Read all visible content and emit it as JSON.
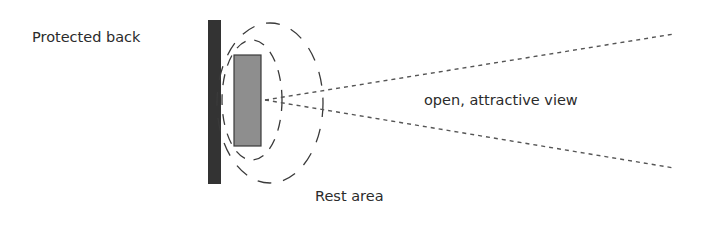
{
  "diagram": {
    "labels": {
      "protected_back": "Protected back",
      "view": "open, attractive view",
      "rest_area": "Rest area"
    },
    "colors": {
      "wall": "#333333",
      "seat_fill": "#8e8e8e",
      "seat_stroke": "#3a3a3a",
      "ellipse_stroke": "#3a3a3a",
      "sightline_stroke": "#555555",
      "text": "#2b2b2b"
    },
    "elements": {
      "wall": {
        "x": 208,
        "y": 20,
        "width": 13,
        "height": 164
      },
      "seat": {
        "x": 234,
        "y": 55,
        "width": 27,
        "height": 91
      },
      "inner_ellipse": {
        "cx": 252,
        "cy": 100,
        "rx": 30,
        "ry": 60
      },
      "outer_ellipse": {
        "cx": 270,
        "cy": 103,
        "rx": 53,
        "ry": 80
      },
      "sightline_origin": {
        "x": 265,
        "y": 100
      },
      "sightline_top_end": {
        "x": 674,
        "y": 34
      },
      "sightline_bottom_end": {
        "x": 674,
        "y": 168
      }
    }
  }
}
